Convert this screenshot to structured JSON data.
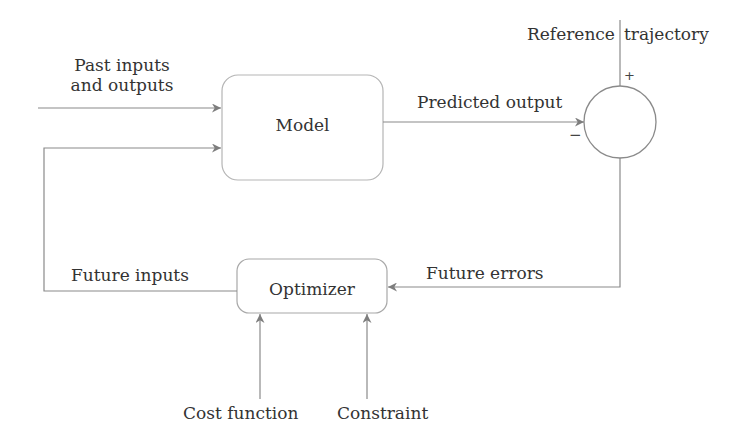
{
  "diagram": {
    "blocks": {
      "model": {
        "label": "Model"
      },
      "optimizer": {
        "label": "Optimizer"
      },
      "summing_junction": {
        "plus_sign": "+",
        "minus_sign": "−"
      }
    },
    "signals": {
      "past_io": {
        "line1": "Past inputs",
        "line2": "and outputs"
      },
      "predicted_output": "Predicted output",
      "reference_left": "Reference",
      "reference_right": "trajectory",
      "future_errors": "Future errors",
      "future_inputs": "Future inputs",
      "cost_function": "Cost function",
      "constraint": "Constraint"
    },
    "colors": {
      "line": "#8a8a8a",
      "box_border": "#b0b0b0",
      "text": "#333333"
    }
  }
}
